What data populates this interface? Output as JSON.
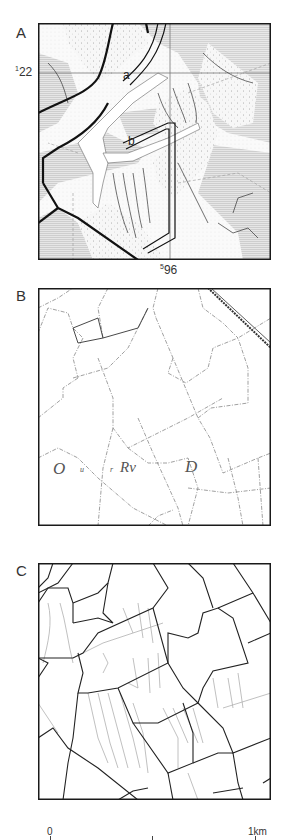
{
  "figure": {
    "panels": [
      {
        "letter": "A",
        "description": "Geological/soil map with shaded zones, stippled areas, thick road lines and drainage network",
        "grid_labels": {
          "northing_sup": "1",
          "northing": "22",
          "easting_sup": "5",
          "easting": "96"
        },
        "point_labels": [
          "a",
          "b"
        ]
      },
      {
        "letter": "B",
        "description": "Historic cadastral map with field boundaries and faint handwritten labels",
        "lettering": [
          "O",
          "u",
          "r",
          "Rv",
          "D"
        ]
      },
      {
        "letter": "C",
        "description": "Redrawn field boundary map (black) with drainage ditches (grey)"
      }
    ],
    "scale_bar": {
      "start_label": "0",
      "end_label": "1km"
    },
    "colors": {
      "frame": "#1a1a1a",
      "shade": "#d8d8d8",
      "stipple": "#f2f2f2",
      "ditch": "#aaaaaa"
    }
  }
}
